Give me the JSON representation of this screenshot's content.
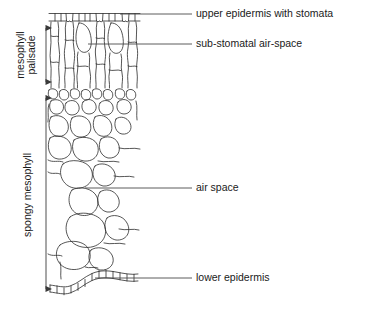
{
  "diagram": {
    "background_color": "#ffffff",
    "line_color": "#2b2b2b",
    "leader_color": "#4a4a4a",
    "text_color": "#1a1a1a"
  },
  "labels": [
    {
      "id": "upper-epidermis",
      "text": "upper epidermis with stomata",
      "text_x": 196,
      "text_y": 14,
      "leader_x1": 120,
      "leader_x2": 192,
      "leader_y": 14
    },
    {
      "id": "sub-stomatal-air-space",
      "text": "sub-stomatal air-space",
      "text_x": 196,
      "text_y": 44,
      "leader_x1": 88,
      "leader_x2": 192,
      "leader_y": 44
    },
    {
      "id": "air-space",
      "text": "air space",
      "text_x": 196,
      "text_y": 188,
      "leader_x1": 85,
      "leader_x2": 192,
      "leader_y": 188
    },
    {
      "id": "lower-epidermis",
      "text": "lower epidermis",
      "text_x": 196,
      "text_y": 278,
      "leader_x1": 95,
      "leader_x2": 192,
      "leader_y": 278
    }
  ],
  "brackets": [
    {
      "id": "palisade-mesophyll",
      "line1": "palisade",
      "line2": "mesophyll",
      "combined": "palisade mesophyll",
      "arrow_x": 46,
      "arrow_y_top": 22,
      "arrow_y_bottom": 88,
      "text_x_line1": 35,
      "text_x_line2": 24,
      "text_y": 55
    },
    {
      "id": "spongy-mesophyll",
      "line1": "spongy mesophyll",
      "combined": "spongy mesophyll",
      "arrow_x": 46,
      "arrow_y_top": 92,
      "arrow_y_bottom": 295,
      "text_x_line1": 31,
      "text_y": 195
    }
  ],
  "tissue_regions": [
    {
      "id": "upper-epidermis-layer",
      "name": "upper epidermis",
      "y_top": 12,
      "y_bottom": 22
    },
    {
      "id": "palisade-layer",
      "name": "palisade mesophyll",
      "y_top": 22,
      "y_bottom": 88
    },
    {
      "id": "spongy-layer",
      "name": "spongy mesophyll",
      "y_top": 88,
      "y_bottom": 285
    },
    {
      "id": "lower-epidermis-layer",
      "name": "lower epidermis",
      "y_top": 262,
      "y_bottom": 292
    }
  ]
}
